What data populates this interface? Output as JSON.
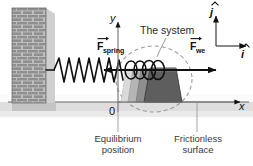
{
  "figure": {
    "title_hidden": "Mass-spring system on frictionless surface",
    "background_color": "#ffffff"
  },
  "labels": {
    "system": "The system",
    "force_spring_symbol": "F",
    "force_spring_subscript": "spring",
    "force_we_symbol": "F",
    "force_we_subscript": "we",
    "axis_y": "y",
    "axis_x": "x",
    "origin": "0",
    "unit_vector_j": "j",
    "unit_vector_i": "i",
    "equilibrium_line1": "Equilibrium",
    "equilibrium_line2": "position",
    "frictionless_line1": "Frictionless",
    "frictionless_line2": "surface"
  },
  "colors": {
    "wall_brick": "#8a8a8a",
    "wall_mortar": "#b9b9b9",
    "wall_shadow": "#c9c9c9",
    "ground": "#ffffff",
    "ground_line": "#585858",
    "ground_shadow": "#d8d8d8",
    "block_light": "#cfcfcf",
    "block_mid": "#9a9a9a",
    "block_dark": "#5a5a5a",
    "spring_stroke": "#111111",
    "arrow": "#111111",
    "dashed_outline": "#9b9b9b",
    "text": "#1a1a1a"
  },
  "geometry": {
    "wall": {
      "x": 12,
      "y": 8,
      "width": 34,
      "height": 95
    },
    "ground_line_y": 102,
    "axis_origin": {
      "x": 118,
      "y": 102
    },
    "axis_y_top": 18,
    "axis_x_right": 243,
    "spring_start_x": 46,
    "spring_end_x": 126,
    "spring_center_y": 70,
    "force_spring_arrow": {
      "x1": 172,
      "y": 70,
      "x2": 102
    },
    "force_we_arrow": {
      "x1": 128,
      "y": 70,
      "x2": 218
    },
    "unit_vector_corner": {
      "x": 216,
      "y": 45
    }
  },
  "annotations": {
    "equilibrium_pointer_x": 118,
    "frictionless_pointer_x": 197,
    "system_pointer_from": {
      "x": 166,
      "y": 38
    },
    "system_pointer_to": {
      "x": 158,
      "y": 56
    }
  }
}
